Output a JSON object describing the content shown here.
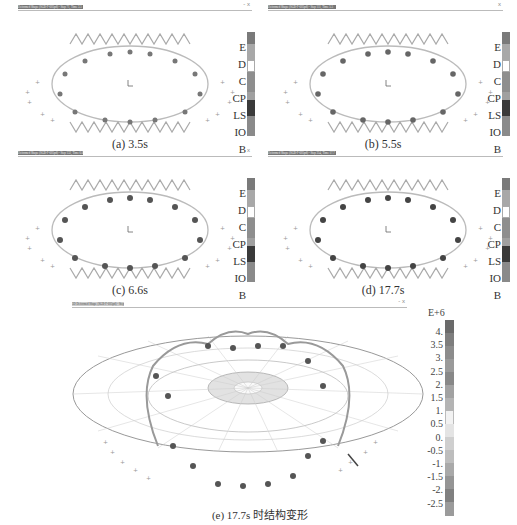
{
  "panels": [
    {
      "id": "a",
      "window_title": "Deformed Shape (SGB-F-605pd) - Step 71, Time 3.5",
      "window_controls": "- x",
      "caption": "(a) 3.5s"
    },
    {
      "id": "b",
      "window_title": "Deformed Shape (SGB-F-605pd) - Step 111, Time 5.5",
      "window_controls": "x",
      "caption": "(b) 5.5s"
    },
    {
      "id": "c",
      "window_title": "Deformed Shape (SGB-F-605pd) - Step 132, Time 6.6",
      "window_controls": "x",
      "caption": "(c) 6.6s"
    },
    {
      "id": "d",
      "window_title": "Deformed Shape (SGB-F-605pd) - Step 354, Time 17.7",
      "window_controls": "x",
      "caption": "(d) 17.7s"
    }
  ],
  "hinge_legend": {
    "labels": [
      "E",
      "D",
      "C",
      "CP",
      "LS",
      "IO",
      "B"
    ],
    "colors": [
      "#7a7a7a",
      "#a8a8a8",
      "#ffffff",
      "#8e8e8e",
      "#a0a0a0",
      "#3a3a3a",
      "#6e6e6e",
      "#9a9a9a"
    ]
  },
  "bottom_panel": {
    "window_title": "3D Deformed Shape (SGB-F-605pd) - Step 171, Time 17.7",
    "window_controls": "- x",
    "caption": "(e) 17.7s 时结构变形",
    "legend_exponent": "E+6",
    "legend_values": [
      "4.",
      "3.5",
      "3.",
      "2.5",
      "2.",
      "1.5",
      "1.",
      "0.5",
      "0.",
      "-0.5",
      "-1.",
      "-1.5",
      "-2.",
      "-2.5"
    ],
    "legend_colors": [
      "#6a6a6a",
      "#7e7e7e",
      "#8c8c8c",
      "#9a9a9a",
      "#888888",
      "#a2a2a2",
      "#b4b4b4",
      "#f2f2f2",
      "#e4e4e4",
      "#cfcfcf",
      "#bdbdbd",
      "#a9a9a9",
      "#959595",
      "#808080",
      "#9b9b9b"
    ]
  }
}
